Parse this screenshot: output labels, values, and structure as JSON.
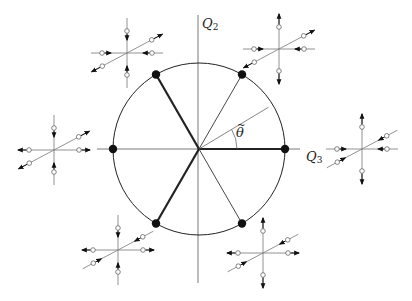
{
  "figure": {
    "axes": {
      "horizontal": {
        "label": "Q",
        "subscript": "3"
      },
      "vertical": {
        "label": "Q",
        "subscript": "2"
      }
    },
    "angle_label": {
      "symbol": "θ",
      "accent": "~"
    },
    "circle": {
      "center": [
        199,
        149
      ],
      "radius": 86,
      "dots_angles_deg": [
        0,
        60,
        120,
        180,
        240,
        300
      ],
      "thick_spokes_deg": [
        0,
        120,
        240
      ],
      "thin_spokes_deg": [
        60,
        300
      ],
      "reference_line_deg": 31,
      "reference_line_length": 81,
      "angle_arc_radius": 38
    },
    "glyphs": [
      {
        "name": "glyph-top-left",
        "center": [
          127,
          53
        ],
        "horizontal": "inward",
        "vertical": "inward",
        "diagonal": "outward"
      },
      {
        "name": "glyph-top-right",
        "center": [
          279,
          49
        ],
        "horizontal": "inward",
        "vertical": "outward",
        "diagonal": "outward"
      },
      {
        "name": "glyph-left",
        "center": [
          54,
          150
        ],
        "horizontal": "outward",
        "vertical": "inward",
        "diagonal": "outward"
      },
      {
        "name": "glyph-right",
        "center": [
          362,
          149
        ],
        "horizontal": "inward",
        "vertical": "outward",
        "diagonal": "inward"
      },
      {
        "name": "glyph-bottom-left",
        "center": [
          118,
          250
        ],
        "horizontal": "outward",
        "vertical": "inward",
        "diagonal": "inward"
      },
      {
        "name": "glyph-bottom-right",
        "center": [
          263,
          253
        ],
        "horizontal": "outward",
        "vertical": "outward",
        "diagonal": "inward"
      }
    ]
  }
}
